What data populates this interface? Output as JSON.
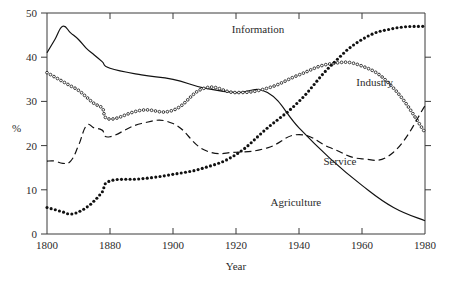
{
  "chart_data": {
    "type": "line",
    "title": "",
    "xlabel": "Year",
    "ylabel": "%",
    "xlim": [
      1800,
      1980
    ],
    "ylim": [
      0,
      50
    ],
    "grid": false,
    "legend_position": "inline-annotations",
    "x_ticks": [
      1800,
      1880,
      1900,
      1920,
      1940,
      1960,
      1980
    ],
    "x_tick_labels": [
      "1800",
      "1880",
      "1900",
      "1920",
      "1940",
      "1960",
      "1980"
    ],
    "x_axis_note": "compressed first interval: 1800 to 1880 occupies one tick spacing, thereafter 20-year spacing",
    "y_ticks": [
      0,
      10,
      20,
      30,
      40,
      50
    ],
    "y_tick_labels": [
      "0",
      "10",
      "20",
      "30",
      "40",
      "50"
    ],
    "series": [
      {
        "name": "Agriculture",
        "style": "solid",
        "label_x": 1939,
        "label_y": 6.4,
        "x": [
          1800,
          1810,
          1820,
          1830,
          1840,
          1850,
          1860,
          1870,
          1880,
          1890,
          1900,
          1910,
          1920,
          1930,
          1940,
          1950,
          1960,
          1970,
          1980
        ],
        "values": [
          41,
          44,
          47,
          45.5,
          44,
          42,
          40.5,
          39,
          37.5,
          36,
          35,
          33,
          32,
          32,
          24,
          17,
          11,
          6,
          3
        ]
      },
      {
        "name": "Industry",
        "style": "open-dots",
        "label_x": 1964,
        "label_y": 33.5,
        "x": [
          1800,
          1810,
          1820,
          1830,
          1840,
          1850,
          1860,
          1870,
          1880,
          1890,
          1900,
          1910,
          1920,
          1930,
          1940,
          1950,
          1960,
          1970,
          1980
        ],
        "values": [
          36.5,
          35.5,
          34.5,
          33.5,
          32.5,
          31,
          29.5,
          28.5,
          26,
          28,
          28,
          33,
          32,
          33,
          36,
          38.5,
          38,
          33,
          23
        ]
      },
      {
        "name": "Service",
        "style": "dashed",
        "label_x": 1953,
        "label_y": 15.6,
        "x": [
          1800,
          1810,
          1820,
          1830,
          1840,
          1850,
          1860,
          1870,
          1880,
          1890,
          1900,
          1910,
          1920,
          1930,
          1940,
          1950,
          1960,
          1970,
          1980
        ],
        "values": [
          16.5,
          16.5,
          16,
          16.5,
          20,
          24.5,
          24,
          23.5,
          22,
          25,
          25,
          19,
          18.5,
          19.5,
          22.5,
          19.5,
          17,
          18.5,
          29
        ]
      },
      {
        "name": "Information",
        "style": "filled-dots",
        "label_x": 1927,
        "label_y": 45.5,
        "x": [
          1800,
          1810,
          1820,
          1830,
          1840,
          1850,
          1860,
          1870,
          1880,
          1890,
          1900,
          1910,
          1920,
          1930,
          1940,
          1950,
          1960,
          1970,
          1980
        ],
        "values": [
          6,
          5.5,
          5,
          4.5,
          5,
          6,
          7.5,
          9.5,
          12,
          12.5,
          13.5,
          15,
          18,
          24,
          30,
          38,
          44,
          46.5,
          47
        ]
      }
    ]
  },
  "figure": {
    "background": "#ffffff",
    "ink_color": "#111111"
  }
}
